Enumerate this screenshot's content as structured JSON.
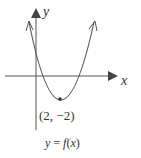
{
  "diagram": {
    "axis_x_label": "x",
    "axis_y_label": "y",
    "vertex_label": "(2, −2)",
    "vertex": {
      "x": 2,
      "y": -2
    },
    "caption_y": "y",
    "caption_eq": " = ",
    "caption_f": "f",
    "caption_paren_open": "(",
    "caption_x": "x",
    "caption_paren_close": ")",
    "curve_type": "upward parabola with arrows at both ends",
    "colors": {
      "stroke": "#555555",
      "text": "#333333"
    }
  }
}
